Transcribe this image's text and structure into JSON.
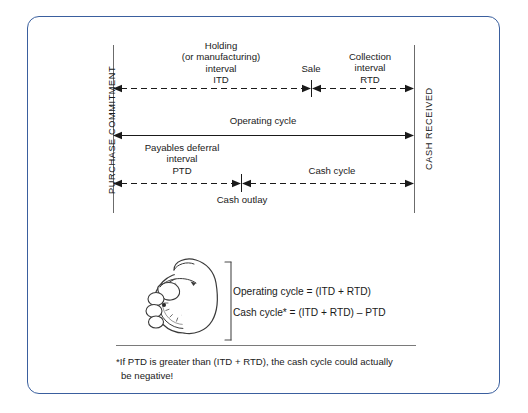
{
  "figure": {
    "border_color": "#3a5f9e",
    "line_color": "#6b6b6b",
    "ink_color": "#1a1a1a"
  },
  "timeline": {
    "start_axis_label": "PURCHASE COMMITMENT",
    "end_axis_label": "CASH RECEIVED",
    "events": {
      "sale": "Sale",
      "cash_outlay": "Cash outlay"
    },
    "intervals": [
      {
        "name": "holding-interval",
        "lines": [
          "Holding",
          "(or manufacturing)",
          "interval",
          "ITD"
        ],
        "style": "dashed"
      },
      {
        "name": "collection-interval",
        "lines": [
          "Collection",
          "interval",
          "RTD"
        ],
        "style": "dashed"
      },
      {
        "name": "operating-cycle",
        "lines": [
          "Operating cycle"
        ],
        "style": "solid"
      },
      {
        "name": "payables-deferral-interval",
        "lines": [
          "Payables deferral",
          "interval",
          "PTD"
        ],
        "style": "dashed"
      },
      {
        "name": "cash-cycle",
        "lines": [
          "Cash cycle"
        ],
        "style": "dashed"
      }
    ]
  },
  "formulas": [
    "Operating cycle = (ITD + RTD)",
    "Cash cycle* = (ITD + RTD) – PTD"
  ],
  "footnote": {
    "line1": "*If PTD is greater than (ITD + RTD), the cash cycle could actually",
    "line2": "be negative!"
  },
  "icons": {
    "stopwatch": "stopwatch-in-hand-icon",
    "bracket": "curly-bracket-icon"
  }
}
